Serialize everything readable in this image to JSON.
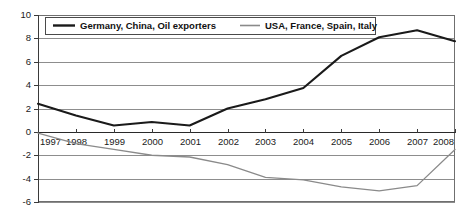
{
  "chart_data": {
    "type": "line",
    "title": "",
    "subtitle": "",
    "xlabel": "",
    "ylabel": "",
    "x": [
      1997,
      1998,
      1999,
      2000,
      2001,
      2002,
      2003,
      2004,
      2005,
      2006,
      2007,
      2008
    ],
    "categories": [
      "1997",
      "1998",
      "1999",
      "2000",
      "2001",
      "2002",
      "2003",
      "2004",
      "2005",
      "2006",
      "2007",
      "2008"
    ],
    "xlim": [
      1997,
      2008
    ],
    "ylim": [
      -6,
      10
    ],
    "yticks": [
      10,
      8,
      6,
      4,
      2,
      0,
      -2,
      -4,
      -6
    ],
    "ytick_labels": [
      "10",
      "8",
      "6",
      "4",
      "2",
      "0",
      "-2",
      "-4",
      "-6"
    ],
    "grid": true,
    "grid_axis": "y",
    "legend_position": "top-inside",
    "zero_line": 0,
    "series": [
      {
        "name": "Germany, China, Oil exporters",
        "color": "#1a1a1a",
        "width": 2.1,
        "values": [
          2.4,
          1.4,
          0.55,
          0.85,
          0.55,
          2.0,
          2.8,
          3.75,
          6.5,
          8.1,
          8.7,
          7.75
        ]
      },
      {
        "name": "USA, France, Spain, Italy",
        "color": "#8a8a8a",
        "width": 1.3,
        "values": [
          -0.1,
          -1.0,
          -1.5,
          -2.0,
          -2.15,
          -2.8,
          -3.9,
          -4.1,
          -4.7,
          -5.05,
          -4.6,
          -1.5
        ]
      }
    ]
  },
  "legend": {
    "items": [
      {
        "label": "Germany, China, Oil exporters"
      },
      {
        "label": "USA, France, Spain, Italy"
      }
    ]
  }
}
